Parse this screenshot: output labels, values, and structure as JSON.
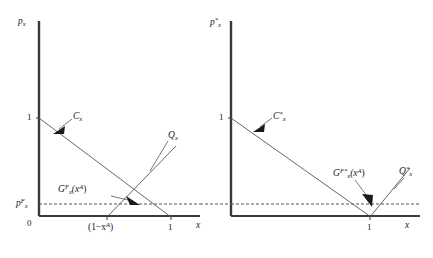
{
  "figure": {
    "type": "economics-diagram",
    "background_color": "#ffffff",
    "line_color": "#3a3a3a",
    "axis_color": "#3a3a3a",
    "dashed_color": "#555555"
  },
  "panels": [
    {
      "id": "home",
      "axes": {
        "y_label": "p",
        "y_label_sub": "x",
        "y_label_sup": "",
        "x_label": "x",
        "origin_label": "0"
      },
      "y_ticks": [
        {
          "label": "1",
          "value": 1
        },
        {
          "label": "p",
          "sup": "F",
          "sub": "x",
          "value": 0.18
        }
      ],
      "x_ticks": [
        {
          "label": "(1−x",
          "sup": "A",
          "close": ")",
          "value": 0.52
        },
        {
          "label": "1",
          "value": 1
        }
      ],
      "curves": [
        {
          "name": "C_x",
          "label": "C",
          "label_sub": "x",
          "label_sup": "",
          "kind": "demand",
          "from": [
            0,
            1
          ],
          "to": [
            1,
            0
          ]
        },
        {
          "name": "Q_x",
          "label": "Q",
          "label_sub": "x",
          "label_sup": "",
          "kind": "supply",
          "from": [
            0.52,
            0
          ],
          "to": [
            1.02,
            0.66
          ]
        }
      ],
      "annotations": [
        {
          "name": "G_x_F",
          "label": "G",
          "label_sup": "F",
          "label_sub": "x",
          "arg": "(x",
          "arg_sup": "A",
          "arg_close": ")",
          "points_to": "intersection-of-Cx-Qx-at-world-price"
        }
      ],
      "dashed_line": {
        "label": "world price level",
        "value": 0.18
      }
    },
    {
      "id": "foreign",
      "axes": {
        "y_label": "p",
        "y_label_sub": "x",
        "y_label_sup": "*",
        "x_label": "x",
        "origin_label": ""
      },
      "y_ticks": [
        {
          "label": "1",
          "value": 1
        }
      ],
      "x_ticks": [
        {
          "label": "1",
          "value": 1
        }
      ],
      "curves": [
        {
          "name": "C_x_star",
          "label": "C",
          "label_sub": "x",
          "label_sup": "*",
          "kind": "demand",
          "from": [
            0,
            1
          ],
          "to": [
            1,
            0
          ]
        },
        {
          "name": "Q_x_star",
          "label": "Q",
          "label_sub": "x",
          "label_sup": "*",
          "kind": "supply",
          "from": [
            1,
            0
          ],
          "to": [
            1.3,
            0.52
          ]
        }
      ],
      "annotations": [
        {
          "name": "G_x_F_star",
          "label": "G",
          "label_sup": "F*",
          "label_sub": "x",
          "arg": "(x",
          "arg_sup": "A",
          "arg_close": ")",
          "points_to": "intersection-at-x-equals-1"
        }
      ],
      "dashed_line": {
        "label": "world price level",
        "value": 0.18
      }
    }
  ]
}
